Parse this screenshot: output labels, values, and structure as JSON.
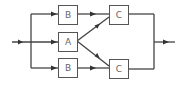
{
  "diagram": {
    "type": "block-diagram",
    "blocks": [
      {
        "id": "b_top",
        "label": "B"
      },
      {
        "id": "a_mid",
        "label": "A"
      },
      {
        "id": "b_bot",
        "label": "B"
      },
      {
        "id": "c_top",
        "label": "C"
      },
      {
        "id": "c_bot",
        "label": "C"
      }
    ],
    "edges": [
      {
        "from": "input",
        "to": "b_top"
      },
      {
        "from": "input",
        "to": "a_mid"
      },
      {
        "from": "input",
        "to": "b_bot"
      },
      {
        "from": "b_top",
        "to": "c_top"
      },
      {
        "from": "a_mid",
        "to": "c_top"
      },
      {
        "from": "a_mid",
        "to": "c_bot"
      },
      {
        "from": "b_bot",
        "to": "c_bot"
      },
      {
        "from": "c_top",
        "to": "output"
      },
      {
        "from": "c_bot",
        "to": "output"
      }
    ],
    "colors": {
      "line": "#444444",
      "box_border": "#555555",
      "label": "#666666",
      "background": "#ffffff"
    }
  }
}
